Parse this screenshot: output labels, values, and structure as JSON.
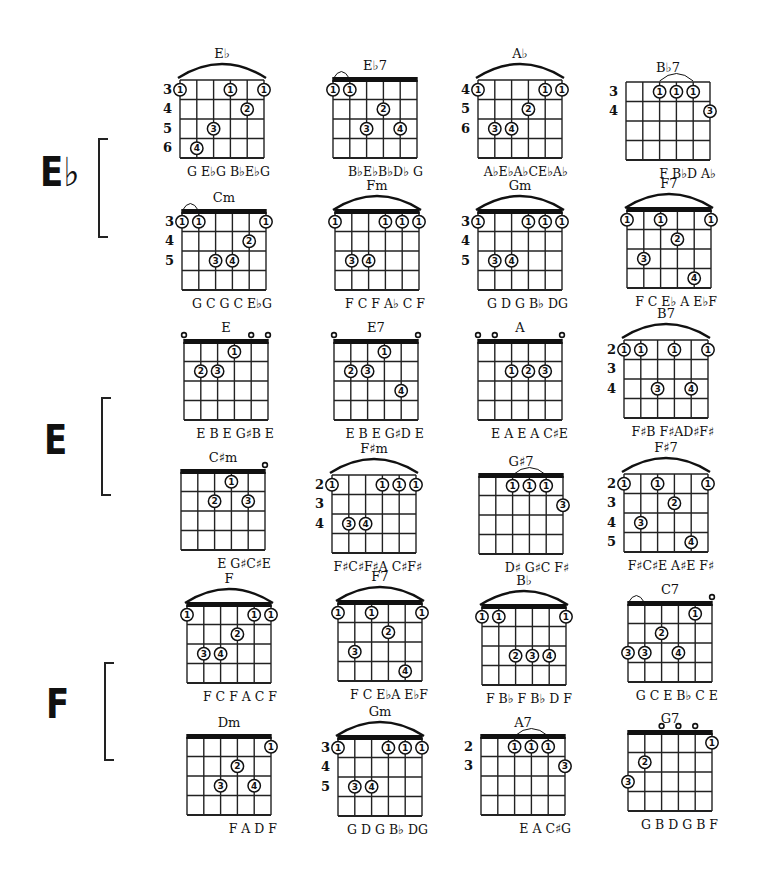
{
  "keys": [
    {
      "label": "E♭",
      "x": 40,
      "y": 152,
      "bracket": {
        "x": 98,
        "y": 138,
        "h": 96
      }
    },
    {
      "label": "E",
      "x": 44,
      "y": 420,
      "bracket": {
        "x": 101,
        "y": 397,
        "h": 95
      }
    },
    {
      "label": "F",
      "x": 46,
      "y": 684,
      "bracket": {
        "x": 104,
        "y": 662,
        "h": 95
      }
    }
  ],
  "chords": [
    {
      "name": "E♭",
      "x": 180,
      "y": 80,
      "nut": false,
      "barre_arc": [
        0,
        5
      ],
      "fret_numbers": [
        "3",
        "4",
        "5",
        "6"
      ],
      "dots": [
        [
          0,
          0,
          "1"
        ],
        [
          3,
          0,
          "1"
        ],
        [
          5,
          0,
          "1"
        ],
        [
          4,
          1,
          "2"
        ],
        [
          2,
          2,
          "3"
        ],
        [
          1,
          3,
          "4"
        ]
      ],
      "open": [],
      "notes": "G  E♭G  B♭E♭G"
    },
    {
      "name": "E♭7",
      "x": 333,
      "y": 80,
      "nut": true,
      "small_arc": [
        0,
        1
      ],
      "fret_numbers": [],
      "dots": [
        [
          0,
          0,
          "1"
        ],
        [
          1,
          0,
          "1"
        ],
        [
          3,
          1,
          "2"
        ],
        [
          2,
          2,
          "3"
        ],
        [
          4,
          2,
          "4"
        ]
      ],
      "open": [],
      "notes": "B♭E♭B♭D♭ G"
    },
    {
      "name": "A♭",
      "x": 478,
      "y": 80,
      "nut": false,
      "barre_arc": [
        0,
        5
      ],
      "fret_numbers": [
        "4",
        "5",
        "6"
      ],
      "dots": [
        [
          0,
          0,
          "1"
        ],
        [
          4,
          0,
          "1"
        ],
        [
          5,
          0,
          "1"
        ],
        [
          3,
          1,
          "2"
        ],
        [
          1,
          2,
          "3"
        ],
        [
          2,
          2,
          "4"
        ]
      ],
      "open": [],
      "notes": "A♭E♭A♭CE♭A♭"
    },
    {
      "name": "B♭7",
      "x": 626,
      "y": 82,
      "nut": false,
      "small_arc": [
        2,
        4
      ],
      "fret_numbers": [
        "3",
        "4"
      ],
      "dots": [
        [
          2,
          0,
          "1"
        ],
        [
          3,
          0,
          "1"
        ],
        [
          4,
          0,
          "1"
        ],
        [
          5,
          1,
          "3"
        ]
      ],
      "open": [],
      "notes": "F B♭D A♭"
    },
    {
      "name": "Cm",
      "x": 182,
      "y": 212,
      "nut": true,
      "small_arc": [
        0,
        1
      ],
      "fret_numbers": [
        "3",
        "4",
        "5"
      ],
      "dots": [
        [
          0,
          0,
          "1"
        ],
        [
          1,
          0,
          "1"
        ],
        [
          5,
          0,
          "1"
        ],
        [
          4,
          1,
          "2"
        ],
        [
          2,
          2,
          "3"
        ],
        [
          3,
          2,
          "4"
        ]
      ],
      "open": [],
      "notes": "G  C G  C  E♭G"
    },
    {
      "name": "Fm",
      "x": 335,
      "y": 212,
      "nut": true,
      "barre_arc": [
        0,
        5
      ],
      "fret_numbers": [],
      "dots": [
        [
          0,
          0,
          "1"
        ],
        [
          3,
          0,
          "1"
        ],
        [
          4,
          0,
          "1"
        ],
        [
          5,
          0,
          "1"
        ],
        [
          1,
          2,
          "3"
        ],
        [
          2,
          2,
          "4"
        ]
      ],
      "open": [],
      "notes": "F  C  F  A♭ C F"
    },
    {
      "name": "Gm",
      "x": 478,
      "y": 212,
      "nut": true,
      "barre_arc": [
        0,
        5
      ],
      "fret_numbers": [
        "3",
        "4",
        "5"
      ],
      "dots": [
        [
          0,
          0,
          "1"
        ],
        [
          3,
          0,
          "1"
        ],
        [
          4,
          0,
          "1"
        ],
        [
          5,
          0,
          "1"
        ],
        [
          1,
          2,
          "3"
        ],
        [
          2,
          2,
          "4"
        ]
      ],
      "open": [],
      "notes": "G D  G  B♭ DG"
    },
    {
      "name": "F7",
      "x": 627,
      "y": 210,
      "nut": true,
      "barre_arc": [
        0,
        5
      ],
      "fret_numbers": [],
      "dots": [
        [
          0,
          0,
          "1"
        ],
        [
          2,
          0,
          "1"
        ],
        [
          5,
          0,
          "1"
        ],
        [
          3,
          1,
          "2"
        ],
        [
          1,
          2,
          "3"
        ],
        [
          4,
          3,
          "4"
        ]
      ],
      "open": [],
      "notes": "F C  E♭ A  E♭F"
    },
    {
      "name": "E",
      "x": 184,
      "y": 342,
      "nut": true,
      "fret_numbers": [],
      "dots": [
        [
          3,
          0,
          "1"
        ],
        [
          1,
          1,
          "2"
        ],
        [
          2,
          1,
          "3"
        ]
      ],
      "open": [
        0,
        4,
        5
      ],
      "notes": "E B E G♯B E"
    },
    {
      "name": "E7",
      "x": 334,
      "y": 342,
      "nut": true,
      "fret_numbers": [],
      "dots": [
        [
          3,
          0,
          "1"
        ],
        [
          1,
          1,
          "2"
        ],
        [
          2,
          1,
          "3"
        ],
        [
          4,
          2,
          "4"
        ]
      ],
      "open": [
        0,
        5
      ],
      "notes": "E B  E  G♯D E"
    },
    {
      "name": "A",
      "x": 478,
      "y": 342,
      "nut": true,
      "fret_numbers": [],
      "dots": [
        [
          2,
          1,
          "1"
        ],
        [
          3,
          1,
          "2"
        ],
        [
          4,
          1,
          "3"
        ]
      ],
      "open": [
        0,
        1,
        5
      ],
      "notes": "E  A  E  A  C♯E"
    },
    {
      "name": "B7",
      "x": 624,
      "y": 340,
      "nut": false,
      "barre_arc": [
        0,
        5
      ],
      "fret_numbers": [
        "2",
        "3",
        "4"
      ],
      "dots": [
        [
          0,
          0,
          "1"
        ],
        [
          1,
          0,
          "1"
        ],
        [
          3,
          0,
          "1"
        ],
        [
          5,
          0,
          "1"
        ],
        [
          2,
          2,
          "3"
        ],
        [
          4,
          2,
          "4"
        ]
      ],
      "open": [],
      "notes": "F♯B  F♯AD♯F♯"
    },
    {
      "name": "C♯m",
      "x": 181,
      "y": 472,
      "nut": true,
      "fret_numbers": [],
      "dots": [
        [
          3,
          0,
          "1"
        ],
        [
          2,
          1,
          "2"
        ],
        [
          4,
          1,
          "3"
        ]
      ],
      "open": [
        5
      ],
      "notes": "E G♯C♯E"
    },
    {
      "name": "F♯m",
      "x": 332,
      "y": 475,
      "nut": false,
      "barre_arc": [
        0,
        5
      ],
      "fret_numbers": [
        "2",
        "3",
        "4"
      ],
      "dots": [
        [
          0,
          0,
          "1"
        ],
        [
          3,
          0,
          "1"
        ],
        [
          4,
          0,
          "1"
        ],
        [
          5,
          0,
          "1"
        ],
        [
          1,
          2,
          "3"
        ],
        [
          2,
          2,
          "4"
        ]
      ],
      "open": [],
      "notes": "F♯C♯F♯A C♯F♯"
    },
    {
      "name": "G♯7",
      "x": 479,
      "y": 476,
      "nut": true,
      "small_arc": [
        2,
        4
      ],
      "fret_numbers": [],
      "dots": [
        [
          2,
          0,
          "1"
        ],
        [
          3,
          0,
          "1"
        ],
        [
          4,
          0,
          "1"
        ],
        [
          5,
          1,
          "3"
        ]
      ],
      "open": [],
      "notes": "D♯ G♯C F♯"
    },
    {
      "name": "F♯7",
      "x": 624,
      "y": 474,
      "nut": false,
      "barre_arc": [
        0,
        5
      ],
      "fret_numbers": [
        "2",
        "3",
        "4",
        "5"
      ],
      "dots": [
        [
          0,
          0,
          "1"
        ],
        [
          2,
          0,
          "1"
        ],
        [
          5,
          0,
          "1"
        ],
        [
          3,
          1,
          "2"
        ],
        [
          1,
          2,
          "3"
        ],
        [
          4,
          3,
          "4"
        ]
      ],
      "open": [],
      "notes": "F♯C♯E A♯E F♯"
    },
    {
      "name": "F",
      "x": 187,
      "y": 605,
      "nut": true,
      "barre_arc": [
        0,
        5
      ],
      "fret_numbers": [],
      "dots": [
        [
          0,
          0,
          "1"
        ],
        [
          4,
          0,
          "1"
        ],
        [
          5,
          0,
          "1"
        ],
        [
          3,
          1,
          "2"
        ],
        [
          1,
          2,
          "3"
        ],
        [
          2,
          2,
          "4"
        ]
      ],
      "open": [],
      "notes": "F C F  A  C  F"
    },
    {
      "name": "F7",
      "x": 338,
      "y": 603,
      "nut": true,
      "barre_arc": [
        0,
        5
      ],
      "fret_numbers": [],
      "dots": [
        [
          0,
          0,
          "1"
        ],
        [
          2,
          0,
          "1"
        ],
        [
          5,
          0,
          "1"
        ],
        [
          3,
          1,
          "2"
        ],
        [
          1,
          2,
          "3"
        ],
        [
          4,
          3,
          "4"
        ]
      ],
      "open": [],
      "notes": "F  C  E♭A  E♭F"
    },
    {
      "name": "B♭",
      "x": 482,
      "y": 607,
      "nut": true,
      "barre_arc": [
        0,
        5
      ],
      "fret_numbers": [],
      "dots": [
        [
          0,
          0,
          "1"
        ],
        [
          1,
          0,
          "1"
        ],
        [
          5,
          0,
          "1"
        ],
        [
          2,
          2,
          "2"
        ],
        [
          3,
          2,
          "3"
        ],
        [
          4,
          2,
          "4"
        ]
      ],
      "open": [],
      "notes": "F B♭ F B♭  D  F"
    },
    {
      "name": "C7",
      "x": 628,
      "y": 604,
      "nut": true,
      "small_arc": [
        0,
        1
      ],
      "fret_numbers": [],
      "dots": [
        [
          4,
          0,
          "1"
        ],
        [
          2,
          1,
          "2"
        ],
        [
          0,
          2,
          "3"
        ],
        [
          1,
          2,
          "3"
        ],
        [
          3,
          2,
          "4"
        ]
      ],
      "open": [
        5
      ],
      "notes": "G C  E  B♭ C E"
    },
    {
      "name": "Dm",
      "x": 187,
      "y": 737,
      "nut": true,
      "fret_numbers": [],
      "dots": [
        [
          5,
          0,
          "1"
        ],
        [
          3,
          1,
          "2"
        ],
        [
          2,
          2,
          "3"
        ],
        [
          4,
          2,
          "4"
        ]
      ],
      "open": [],
      "notes": "F  A  D  F"
    },
    {
      "name": "Gm",
      "x": 338,
      "y": 738,
      "nut": true,
      "barre_arc": [
        0,
        5
      ],
      "fret_numbers": [
        "3",
        "4",
        "5"
      ],
      "dots": [
        [
          0,
          0,
          "1"
        ],
        [
          3,
          0,
          "1"
        ],
        [
          4,
          0,
          "1"
        ],
        [
          5,
          0,
          "1"
        ],
        [
          1,
          2,
          "3"
        ],
        [
          2,
          2,
          "4"
        ]
      ],
      "open": [],
      "notes": "G  D G  B♭ DG"
    },
    {
      "name": "A7",
      "x": 481,
      "y": 737,
      "nut": true,
      "small_arc": [
        2,
        4
      ],
      "fret_numbers": [
        "2",
        "3"
      ],
      "dots": [
        [
          2,
          0,
          "1"
        ],
        [
          3,
          0,
          "1"
        ],
        [
          4,
          0,
          "1"
        ],
        [
          5,
          1,
          "3"
        ]
      ],
      "open": [],
      "notes": "E A C♯G"
    },
    {
      "name": "G7",
      "x": 628,
      "y": 733,
      "nut": true,
      "fret_numbers": [],
      "dots": [
        [
          5,
          0,
          "1"
        ],
        [
          1,
          1,
          "2"
        ],
        [
          0,
          2,
          "3"
        ]
      ],
      "open": [
        2,
        3,
        4
      ],
      "notes": "G B  D  G  B  F"
    }
  ],
  "geometry": {
    "string_gap": 16.8,
    "fret_gap": 19.5,
    "frets": 4,
    "dot_radius": 6.2
  }
}
